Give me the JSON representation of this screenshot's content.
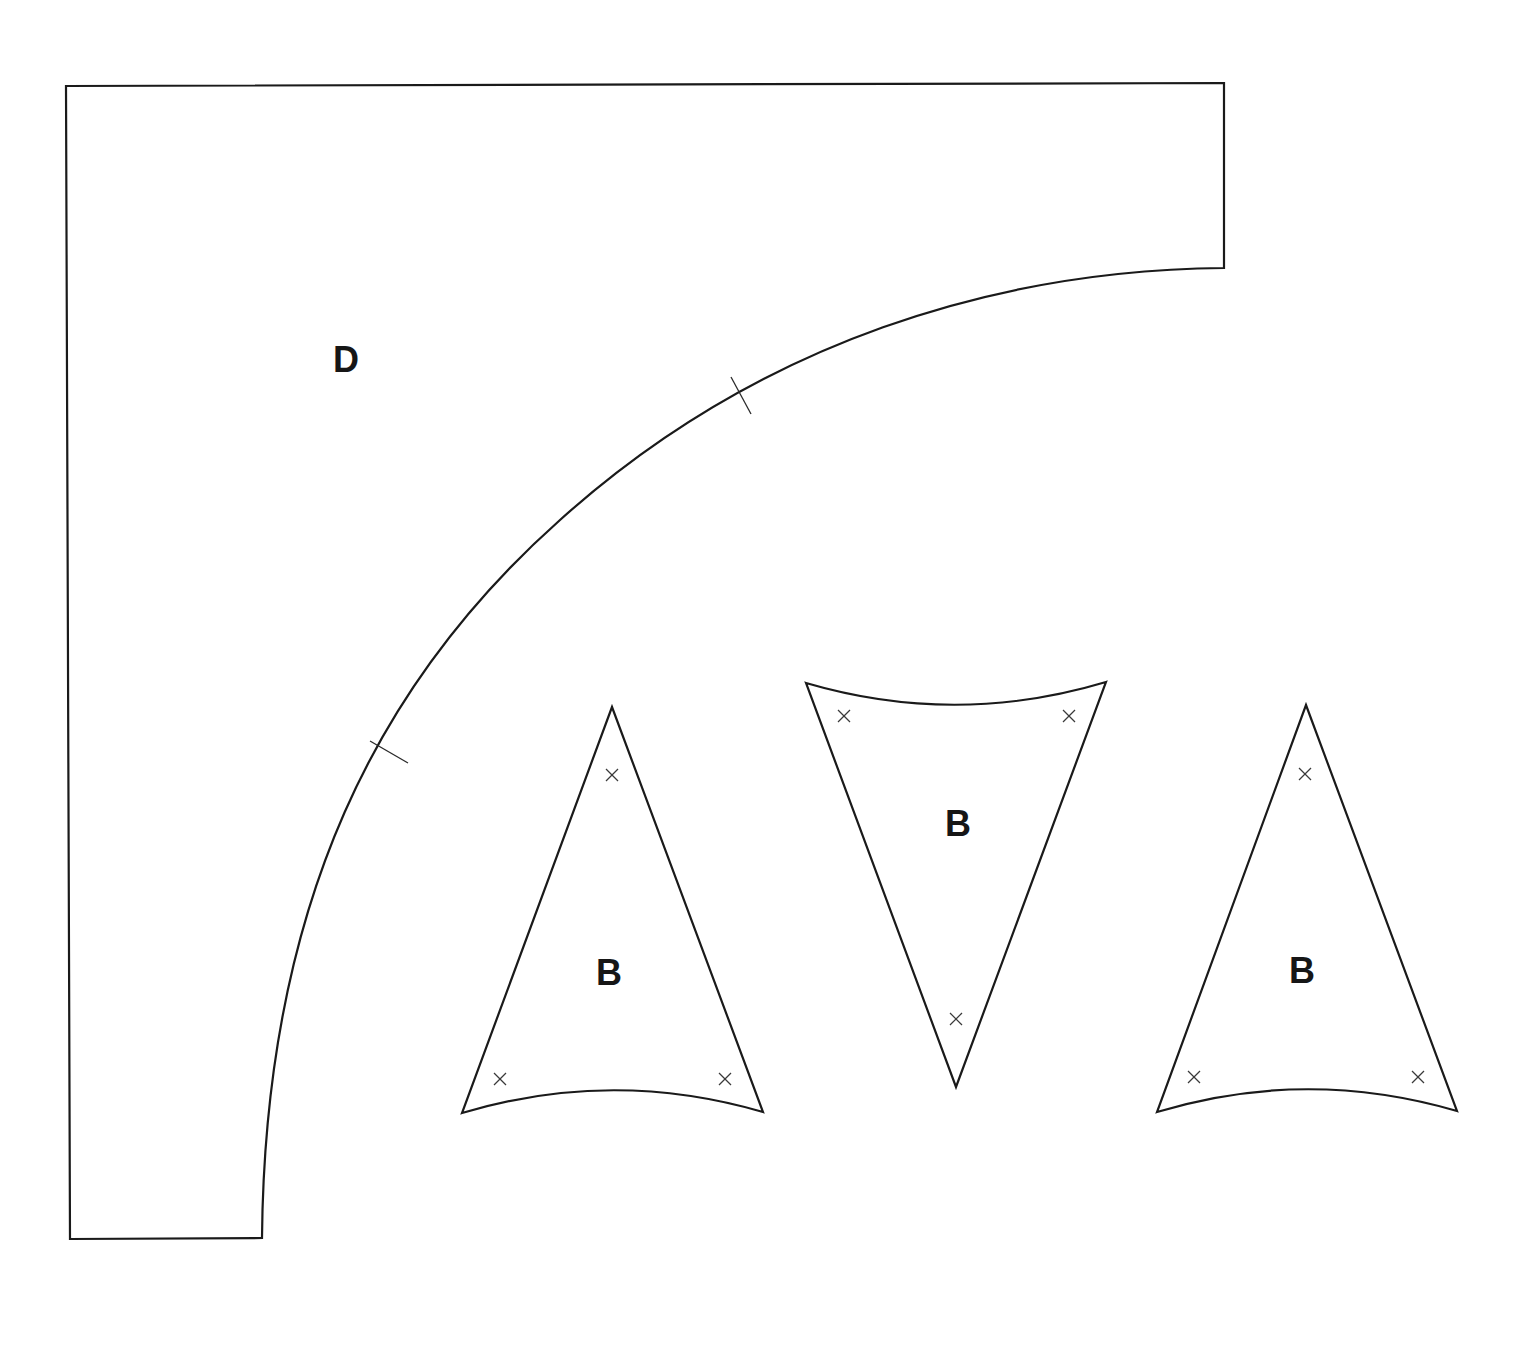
{
  "diagram": {
    "type": "quilt-template-pattern",
    "background": "#ffffff",
    "stroke_color": "#1a1a1a",
    "pieces": [
      {
        "id": "piece-d",
        "label": "D",
        "shape": "quarter-arc corner piece",
        "notch_marks": 2
      },
      {
        "id": "piece-b-1",
        "label": "B",
        "shape": "curved-base triangle, point up",
        "x_marks": 3
      },
      {
        "id": "piece-b-2",
        "label": "B",
        "shape": "curved-base triangle, point down",
        "x_marks": 3
      },
      {
        "id": "piece-b-3",
        "label": "B",
        "shape": "curved-base triangle, point up",
        "x_marks": 3
      }
    ]
  }
}
